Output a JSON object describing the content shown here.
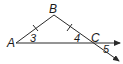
{
  "diagram": {
    "title": "",
    "stroke_color": "#2a2a2a",
    "background": "#ffffff",
    "points": {
      "A": {
        "label": "A",
        "x": 15,
        "y": 43
      },
      "B": {
        "label": "B",
        "x": 54,
        "y": 15
      },
      "C": {
        "label": "C",
        "x": 90,
        "y": 43
      }
    },
    "angles": [
      {
        "label": "3",
        "at": "A"
      },
      {
        "label": "4",
        "at": "C"
      },
      {
        "label": "5",
        "at": "C"
      }
    ],
    "segments": [
      {
        "from": "A",
        "to": "B",
        "congruence_ticks": 1
      },
      {
        "from": "B",
        "to": "C",
        "congruence_ticks": 1
      }
    ],
    "rays": [
      {
        "from": "A",
        "through": "C",
        "arrow": true
      },
      {
        "from": "B",
        "through": "C",
        "arrow": true
      }
    ]
  }
}
